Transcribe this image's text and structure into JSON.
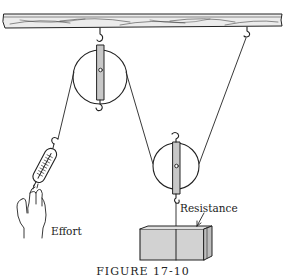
{
  "diagram": {
    "type": "compound pulley system (fixed + movable pulley) with spring scale",
    "labels": {
      "effort": "Effort",
      "resistance": "Resistance"
    },
    "caption": "FIGURE 17-10",
    "components": [
      {
        "id": "ceiling-beam",
        "label": "wooden beam"
      },
      {
        "id": "fixed-pulley",
        "label": "fixed pulley hung from beam"
      },
      {
        "id": "movable-pulley",
        "label": "movable pulley supporting load"
      },
      {
        "id": "spring-scale",
        "label": "spring scale"
      },
      {
        "id": "hand",
        "label": "hand applying effort"
      },
      {
        "id": "load-box",
        "label": "resistance load"
      },
      {
        "id": "rope",
        "label": "rope"
      }
    ],
    "colors": {
      "line": "#222222",
      "pulley_frame": "#c8c8c8",
      "box_fill": "#d0d0d0",
      "beam_fill": "#e8e8e8"
    }
  }
}
